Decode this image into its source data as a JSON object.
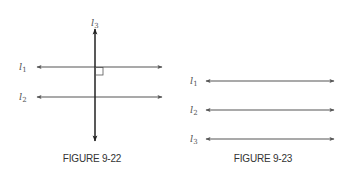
{
  "figures": [
    {
      "caption": "FIGURE 9-22",
      "lines": [
        {
          "name": "l",
          "sub": "1",
          "orientation": "horizontal"
        },
        {
          "name": "l",
          "sub": "2",
          "orientation": "horizontal"
        },
        {
          "name": "l",
          "sub": "3",
          "orientation": "vertical"
        }
      ],
      "right_angle_marker": true
    },
    {
      "caption": "FIGURE 9-23",
      "lines": [
        {
          "name": "l",
          "sub": "1",
          "orientation": "horizontal"
        },
        {
          "name": "l",
          "sub": "2",
          "orientation": "horizontal"
        },
        {
          "name": "l",
          "sub": "3",
          "orientation": "horizontal"
        }
      ]
    }
  ],
  "colors": {
    "line": "#555555",
    "vertical_line": "#222222",
    "text": "#555555"
  }
}
